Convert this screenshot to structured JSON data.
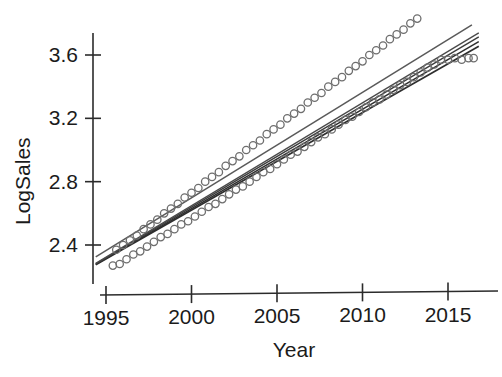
{
  "chart_data": {
    "type": "scatter",
    "title": "",
    "subtitle": "",
    "xlabel": "Year",
    "ylabel": "LogSales",
    "xlim": [
      1994.3,
      2016.8
    ],
    "ylim": [
      2.22,
      3.78
    ],
    "grid": false,
    "legend": "none",
    "xticks": [
      1995,
      2000,
      2005,
      2010,
      2015
    ],
    "xtick_labels": [
      "1995",
      "2000",
      "2005",
      "2010",
      "2015"
    ],
    "yticks": [
      2.4,
      2.8,
      3.2,
      3.6
    ],
    "ytick_labels": [
      "2.4",
      "2.8",
      "3.2",
      "3.6"
    ],
    "marker": "open-circle",
    "marker_color": "#6e6e6e",
    "series": [
      {
        "name": "upper-group",
        "x": [
          1995.6,
          1996.0,
          1996.4,
          1996.8,
          1997.2,
          1997.6,
          1998.0,
          1998.4,
          1998.8,
          1999.2,
          1999.6,
          2000.0,
          2000.4,
          2000.8,
          2001.2,
          2001.6,
          2002.0,
          2002.4,
          2002.8,
          2003.2,
          2003.6,
          2004.0,
          2004.4,
          2004.8,
          2005.2,
          2005.6,
          2006.0,
          2006.4,
          2006.8,
          2007.2,
          2007.6,
          2008.0,
          2008.4,
          2008.8,
          2009.2,
          2009.6,
          2010.0,
          2010.4,
          2010.8,
          2011.2,
          2011.6,
          2012.0,
          2012.4,
          2012.8,
          2013.2,
          2013.6,
          2014.0,
          2014.4,
          2014.8,
          2015.2
        ],
        "y": [
          2.37,
          2.4,
          2.43,
          2.46,
          2.5,
          2.53,
          2.56,
          2.6,
          2.63,
          2.66,
          2.7,
          2.73,
          2.76,
          2.8,
          2.83,
          2.86,
          2.9,
          2.93,
          2.96,
          3.0,
          3.03,
          3.06,
          3.1,
          3.13,
          3.16,
          3.2,
          3.23,
          3.26,
          3.3,
          3.33,
          3.36,
          3.4,
          3.43,
          3.46,
          3.5,
          3.53,
          3.56,
          3.6,
          3.63,
          3.66,
          3.7,
          3.73,
          3.76,
          3.8,
          3.83,
          3.86,
          3.9,
          3.93,
          3.96,
          4.0
        ]
      },
      {
        "name": "lower-group",
        "x": [
          1995.4,
          1995.8,
          1996.2,
          1996.6,
          1997.0,
          1997.4,
          1997.8,
          1998.2,
          1998.6,
          1999.0,
          1999.4,
          1999.8,
          2000.2,
          2000.6,
          2001.0,
          2001.4,
          2001.8,
          2002.2,
          2002.6,
          2003.0,
          2003.4,
          2003.8,
          2004.2,
          2004.6,
          2005.0,
          2005.4,
          2005.8,
          2006.2,
          2006.6,
          2007.0,
          2007.4,
          2007.8,
          2008.2,
          2008.6,
          2009.0,
          2009.4,
          2009.8,
          2010.2,
          2010.6,
          2011.0,
          2011.4,
          2011.8,
          2012.2,
          2012.6,
          2013.0,
          2013.4,
          2013.8,
          2014.2,
          2014.6,
          2015.0,
          2015.4,
          2015.8,
          2016.2,
          2016.5
        ],
        "y": [
          2.27,
          2.28,
          2.31,
          2.34,
          2.36,
          2.39,
          2.42,
          2.45,
          2.47,
          2.5,
          2.53,
          2.55,
          2.58,
          2.61,
          2.64,
          2.66,
          2.69,
          2.72,
          2.75,
          2.77,
          2.8,
          2.83,
          2.86,
          2.88,
          2.91,
          2.94,
          2.97,
          2.99,
          3.02,
          3.05,
          3.08,
          3.1,
          3.13,
          3.16,
          3.19,
          3.21,
          3.24,
          3.27,
          3.3,
          3.32,
          3.35,
          3.38,
          3.41,
          3.43,
          3.46,
          3.49,
          3.52,
          3.54,
          3.57,
          3.57,
          3.58,
          3.57,
          3.58,
          3.58
        ]
      }
    ],
    "fit_lines": [
      {
        "name": "upper-fit",
        "x0": 1994.4,
        "y0": 2.325,
        "x1": 2016.4,
        "y1": 3.79,
        "color": "#5a5a5a",
        "width": 1.5
      },
      {
        "name": "lower-fit-a",
        "x0": 1994.4,
        "y0": 2.275,
        "x1": 2016.8,
        "y1": 3.655,
        "color": "#2e2e2e",
        "width": 1.7
      },
      {
        "name": "lower-fit-b",
        "x0": 1994.4,
        "y0": 2.278,
        "x1": 2016.8,
        "y1": 3.685,
        "color": "#2e2e2e",
        "width": 1.5
      },
      {
        "name": "lower-fit-c",
        "x0": 1994.4,
        "y0": 2.281,
        "x1": 2016.8,
        "y1": 3.715,
        "color": "#3c3c3c",
        "width": 1.4
      },
      {
        "name": "lower-fit-d",
        "x0": 1994.4,
        "y0": 2.284,
        "x1": 2016.8,
        "y1": 3.74,
        "color": "#4a4a4a",
        "width": 1.3
      }
    ]
  },
  "axis": {
    "y_label": "LogSales",
    "x_label": "Year"
  }
}
